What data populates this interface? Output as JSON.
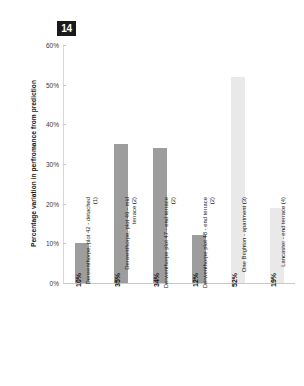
{
  "badge": {
    "label": "14"
  },
  "chart_data": {
    "type": "bar",
    "title": "",
    "xlabel": "",
    "ylabel": "Percentage variation in perfromance from prediction",
    "ylim": [
      0,
      60
    ],
    "ytick_labels": [
      "0%",
      "10%",
      "20%",
      "30%",
      "40%",
      "50%",
      "60%"
    ],
    "ytick_values": [
      0,
      10,
      20,
      30,
      40,
      50,
      60
    ],
    "grid": false,
    "legend": "none",
    "categories": [
      "Derwenthorpe, plot 42 - detached (1)",
      "Derwenthorpe, plot 46 - mid terrace (2)",
      "Derwenthorpe plot 47 - end terrace (2)",
      "Derwenthorpe plot 48 - end terrace (2)",
      "One Brighton - apartment (3)",
      "Lancaster - end terrace (4)"
    ],
    "values": [
      10,
      35,
      34,
      12,
      52,
      19
    ],
    "value_labels": [
      "10%",
      "35%",
      "34%",
      "12%",
      "52%",
      "19%"
    ],
    "bar_colors": [
      "#9d9d9d",
      "#9d9d9d",
      "#9d9d9d",
      "#9d9d9d",
      "#e9e9e9",
      "#e9e9e9"
    ]
  },
  "colors": {
    "bar_dark": "#9d9d9d",
    "bar_light": "#e9e9e9",
    "axis": "#c9c9c9",
    "text": "#1a1a1a",
    "badge_bg": "#1a1a1a",
    "badge_text": "#ffffff"
  }
}
